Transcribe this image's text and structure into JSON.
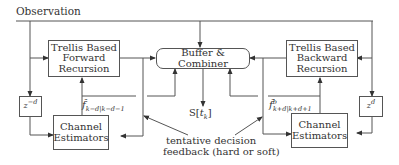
{
  "diagram": {
    "type": "block-diagram",
    "input_label": "Observation",
    "blocks": {
      "forward": {
        "line1": "Trellis Based",
        "line2": "Forward",
        "line3": "Recursion"
      },
      "backward": {
        "line1": "Trellis Based",
        "line2": "Backward",
        "line3": "Recursion"
      },
      "combiner": {
        "label": "Buffer & Combiner"
      },
      "estimator_left": {
        "line1": "Channel",
        "line2": "Estimators"
      },
      "estimator_right": {
        "line1": "Channel",
        "line2": "Estimators"
      },
      "delay_left": {
        "base": "z",
        "exp": "−d"
      },
      "delay_right": {
        "base": "z",
        "exp": "d"
      }
    },
    "signals": {
      "output": {
        "base": "S[",
        "var": "t",
        "sub": "k",
        "close": "]"
      },
      "f_forward": {
        "symbol": "f̂",
        "sub": "k−d|k−d−1"
      },
      "f_backward": {
        "symbol": "f̂",
        "sup": "b",
        "sub": "k+d|k+d+1"
      }
    },
    "annotation": {
      "line1": "tentative decision",
      "line2": "feedback (hard or soft)"
    },
    "colors": {
      "line": "#555555",
      "text": "#333333",
      "background": "#ffffff"
    }
  }
}
